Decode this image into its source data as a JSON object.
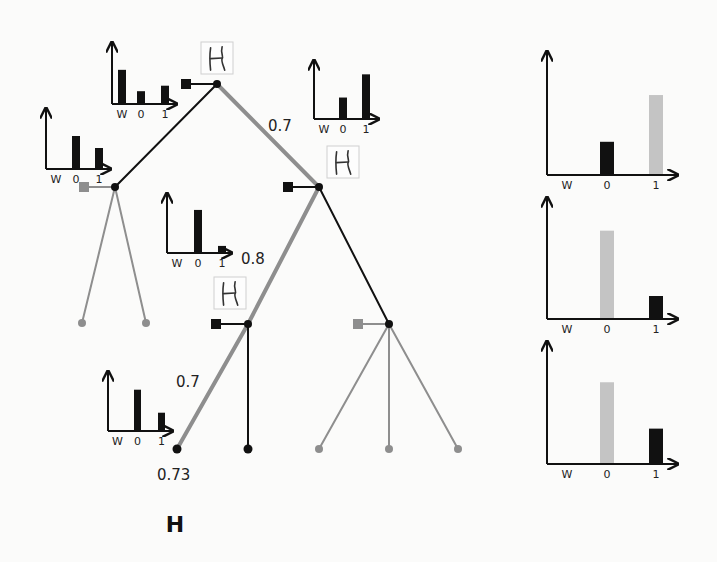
{
  "figure": {
    "caption_letter": "H",
    "colors": {
      "background": "#fbfbfa",
      "ink": "#111111",
      "gray_edge": "#8e8e8e",
      "gray_bar": "#c4c4c4",
      "thumbnail_border": "#cfcfcf"
    },
    "axis_ticks": [
      "W",
      "0",
      "1"
    ],
    "edge_labels": [
      {
        "id": "root-right",
        "text": "0.7",
        "x": 268,
        "y": 131,
        "size": 15
      },
      {
        "id": "n2-left",
        "text": "0.8",
        "x": 241,
        "y": 264,
        "size": 15
      },
      {
        "id": "n3-left",
        "text": "0.7",
        "x": 176,
        "y": 387,
        "size": 15
      },
      {
        "id": "leaf-score",
        "text": "0.73",
        "x": 157,
        "y": 480,
        "size": 15
      }
    ],
    "thumbnails": [
      {
        "id": "thumb-root",
        "glyph": "H",
        "x": 201,
        "y": 42,
        "w": 32,
        "h": 32
      },
      {
        "id": "thumb-n2",
        "glyph": "H",
        "x": 327,
        "y": 146,
        "w": 32,
        "h": 32
      },
      {
        "id": "thumb-n3",
        "glyph": "H",
        "x": 214,
        "y": 277,
        "w": 32,
        "h": 32
      }
    ]
  },
  "tree": {
    "nodes": [
      {
        "id": "root",
        "x": 217,
        "y": 84,
        "color": "#111111",
        "r": 4,
        "marker": {
          "x": 186,
          "color": "#111111"
        }
      },
      {
        "id": "n1",
        "x": 115,
        "y": 187,
        "color": "#111111",
        "r": 4,
        "marker": {
          "x": 84,
          "color": "#8e8e8e"
        }
      },
      {
        "id": "n2",
        "x": 319,
        "y": 187,
        "color": "#111111",
        "r": 4,
        "marker": {
          "x": 288,
          "color": "#111111"
        }
      },
      {
        "id": "n3",
        "x": 248,
        "y": 324,
        "color": "#111111",
        "r": 4,
        "marker": {
          "x": 216,
          "color": "#111111"
        }
      },
      {
        "id": "n4",
        "x": 389,
        "y": 324,
        "color": "#111111",
        "r": 4,
        "marker": {
          "x": 358,
          "color": "#8e8e8e"
        }
      },
      {
        "id": "leaf-a",
        "x": 82,
        "y": 323,
        "color": "#8e8e8e",
        "r": 4
      },
      {
        "id": "leaf-b",
        "x": 146,
        "y": 323,
        "color": "#8e8e8e",
        "r": 4
      },
      {
        "id": "leaf-c",
        "x": 177,
        "y": 449,
        "color": "#111111",
        "r": 4.5
      },
      {
        "id": "leaf-d",
        "x": 248,
        "y": 449,
        "color": "#111111",
        "r": 4.5
      },
      {
        "id": "leaf-e",
        "x": 319,
        "y": 449,
        "color": "#8e8e8e",
        "r": 4
      },
      {
        "id": "leaf-f",
        "x": 389,
        "y": 449,
        "color": "#8e8e8e",
        "r": 4
      },
      {
        "id": "leaf-g",
        "x": 458,
        "y": 449,
        "color": "#8e8e8e",
        "r": 4
      }
    ],
    "edges": [
      {
        "from": "root",
        "to": "n1",
        "color": "#111111",
        "width": 2
      },
      {
        "from": "root",
        "to": "n2",
        "color": "#8e8e8e",
        "width": 4
      },
      {
        "from": "n1",
        "to": "leaf-a",
        "color": "#8e8e8e",
        "width": 2
      },
      {
        "from": "n1",
        "to": "leaf-b",
        "color": "#8e8e8e",
        "width": 2
      },
      {
        "from": "n2",
        "to": "n3",
        "color": "#8e8e8e",
        "width": 4
      },
      {
        "from": "n2",
        "to": "n4",
        "color": "#111111",
        "width": 2
      },
      {
        "from": "n3",
        "to": "leaf-c",
        "color": "#8e8e8e",
        "width": 4
      },
      {
        "from": "n3",
        "to": "leaf-d",
        "color": "#111111",
        "width": 2
      },
      {
        "from": "n4",
        "to": "leaf-e",
        "color": "#8e8e8e",
        "width": 2
      },
      {
        "from": "n4",
        "to": "leaf-f",
        "color": "#8e8e8e",
        "width": 2
      },
      {
        "from": "n4",
        "to": "leaf-g",
        "color": "#8e8e8e",
        "width": 2
      }
    ]
  },
  "chart_data": [
    {
      "id": "mini-root",
      "type": "bar",
      "title": "",
      "xlabel": "",
      "ylabel": "",
      "categories": [
        "W",
        "0",
        "1"
      ],
      "values": [
        0.56,
        0.21,
        0.3
      ],
      "bar_colors": [
        "#111111",
        "#111111",
        "#111111"
      ],
      "geom": {
        "ox": 112,
        "oy": 104,
        "top": 43,
        "right": 176,
        "barW": 8,
        "barX": [
          118,
          137,
          161
        ],
        "scale": 61,
        "tickY": 118,
        "tickSize": 11
      }
    },
    {
      "id": "mini-n1",
      "type": "bar",
      "title": "",
      "xlabel": "",
      "ylabel": "",
      "categories": [
        "W",
        "0",
        "1"
      ],
      "values": [
        0,
        0.55,
        0.35
      ],
      "bar_colors": [
        "#111111",
        "#111111",
        "#111111"
      ],
      "geom": {
        "ox": 46,
        "oy": 169,
        "top": 109,
        "right": 110,
        "barW": 8,
        "barX": [
          52,
          72,
          95
        ],
        "scale": 60,
        "tickY": 183,
        "tickSize": 11
      }
    },
    {
      "id": "mini-n2",
      "type": "bar",
      "title": "",
      "xlabel": "",
      "ylabel": "",
      "categories": [
        "W",
        "0",
        "1"
      ],
      "values": [
        0,
        0.37,
        0.77
      ],
      "bar_colors": [
        "#111111",
        "#111111",
        "#111111"
      ],
      "geom": {
        "ox": 314,
        "oy": 119,
        "top": 61,
        "right": 378,
        "barW": 8,
        "barX": [
          320,
          339,
          362
        ],
        "scale": 58,
        "tickY": 133,
        "tickSize": 11
      }
    },
    {
      "id": "mini-n3",
      "type": "bar",
      "title": "",
      "xlabel": "",
      "ylabel": "",
      "categories": [
        "W",
        "0",
        "1"
      ],
      "values": [
        0,
        0.73,
        0.12
      ],
      "bar_colors": [
        "#111111",
        "#111111",
        "#111111"
      ],
      "geom": {
        "ox": 167,
        "oy": 253,
        "top": 194,
        "right": 231,
        "barW": 8,
        "barX": [
          173,
          194,
          218
        ],
        "scale": 59,
        "tickY": 267,
        "tickSize": 11
      }
    },
    {
      "id": "mini-leaf",
      "type": "bar",
      "title": "",
      "xlabel": "",
      "ylabel": "",
      "categories": [
        "W",
        "0",
        "1"
      ],
      "values": [
        0,
        0.7,
        0.31
      ],
      "bar_colors": [
        "#111111",
        "#111111",
        "#111111"
      ],
      "geom": {
        "ox": 108,
        "oy": 431,
        "top": 372,
        "right": 172,
        "barW": 7,
        "barX": [
          114,
          134,
          158
        ],
        "scale": 59,
        "tickY": 445,
        "tickSize": 11
      }
    },
    {
      "id": "right-1",
      "type": "bar",
      "title": "",
      "xlabel": "",
      "ylabel": "",
      "categories": [
        "W",
        "0",
        "1"
      ],
      "values": [
        0,
        0.27,
        0.65
      ],
      "bar_colors": [
        "#111111",
        "#111111",
        "#c4c4c4"
      ],
      "geom": {
        "ox": 547,
        "oy": 175,
        "top": 52,
        "right": 677,
        "barW": 14,
        "barX": [
          560,
          600,
          649
        ],
        "scale": 123,
        "tickY": 189,
        "tickSize": 11
      }
    },
    {
      "id": "right-2",
      "type": "bar",
      "title": "",
      "xlabel": "",
      "ylabel": "",
      "categories": [
        "W",
        "0",
        "1"
      ],
      "values": [
        0,
        0.73,
        0.19
      ],
      "bar_colors": [
        "#111111",
        "#c4c4c4",
        "#111111"
      ],
      "geom": {
        "ox": 547,
        "oy": 319,
        "top": 198,
        "right": 677,
        "barW": 14,
        "barX": [
          560,
          600,
          649
        ],
        "scale": 121,
        "tickY": 333,
        "tickSize": 11
      }
    },
    {
      "id": "right-3",
      "type": "bar",
      "title": "",
      "xlabel": "",
      "ylabel": "",
      "categories": [
        "W",
        "0",
        "1"
      ],
      "values": [
        0,
        0.67,
        0.29
      ],
      "bar_colors": [
        "#111111",
        "#c4c4c4",
        "#111111"
      ],
      "geom": {
        "ox": 547,
        "oy": 464,
        "top": 342,
        "right": 677,
        "barW": 14,
        "barX": [
          560,
          600,
          649
        ],
        "scale": 122,
        "tickY": 478,
        "tickSize": 11
      }
    }
  ]
}
